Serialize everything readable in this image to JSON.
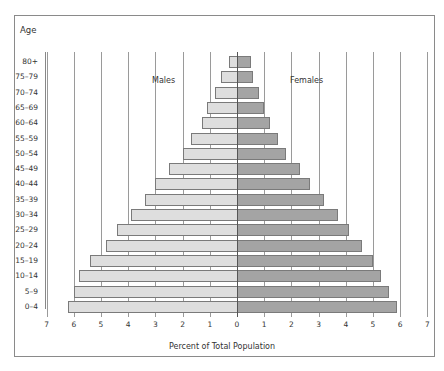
{
  "chart_data": {
    "type": "bar",
    "orientation": "horizontal",
    "subtype": "population-pyramid",
    "title": "",
    "xlabel": "Percent of Total Population",
    "ylabel": "Age",
    "xlim": [
      -7,
      7
    ],
    "xticks": [
      7,
      6,
      5,
      4,
      3,
      2,
      1,
      0,
      1,
      2,
      3,
      4,
      5,
      6,
      7
    ],
    "grid": true,
    "legend": [
      "Males",
      "Females"
    ],
    "categories": [
      "80+",
      "75–79",
      "70–74",
      "65–69",
      "60–64",
      "55–59",
      "50–54",
      "45–49",
      "40–44",
      "35–39",
      "30–34",
      "25–29",
      "20–24",
      "15–19",
      "10–14",
      "5–9",
      "0–4"
    ],
    "series": [
      {
        "name": "Males",
        "color": "#dedede",
        "side": "left",
        "values": [
          0.3,
          0.6,
          0.8,
          1.1,
          1.3,
          1.7,
          2.0,
          2.5,
          3.0,
          3.4,
          3.9,
          4.4,
          4.8,
          5.4,
          5.8,
          6.0,
          6.2
        ]
      },
      {
        "name": "Females",
        "color": "#a4a4a4",
        "side": "right",
        "values": [
          0.5,
          0.6,
          0.8,
          1.0,
          1.2,
          1.5,
          1.8,
          2.3,
          2.7,
          3.2,
          3.7,
          4.1,
          4.6,
          5.0,
          5.3,
          5.6,
          5.9
        ]
      }
    ]
  },
  "labels": {
    "age_title": "Age",
    "males": "Males",
    "females": "Females",
    "xlabel": "Percent of Total Population"
  }
}
